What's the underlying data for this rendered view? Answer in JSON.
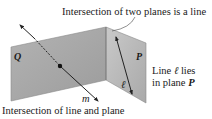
{
  "labels": {
    "top_caption": "Intersection of two planes is a line",
    "bottom_caption": "Intersection of line and plane",
    "right_caption_line1_prefix": "Line ",
    "right_caption_line1_symbol": "ℓ",
    "right_caption_line1_suffix": " lies",
    "right_caption_line2_prefix": "in plane ",
    "right_caption_line2_symbol": "P",
    "plane_q": "Q",
    "plane_p": "P",
    "line_m": "m",
    "line_l": "ℓ"
  },
  "colors": {
    "plane_q_fill": "#a9a9a9",
    "plane_q_fill_light": "#c4c4c4",
    "plane_p_fill": "#b8b8b8",
    "plane_p_fill_light": "#d0d0d0",
    "plane_edge": "#8a8a8a",
    "line": "#222222",
    "text": "#1a1a1a"
  }
}
